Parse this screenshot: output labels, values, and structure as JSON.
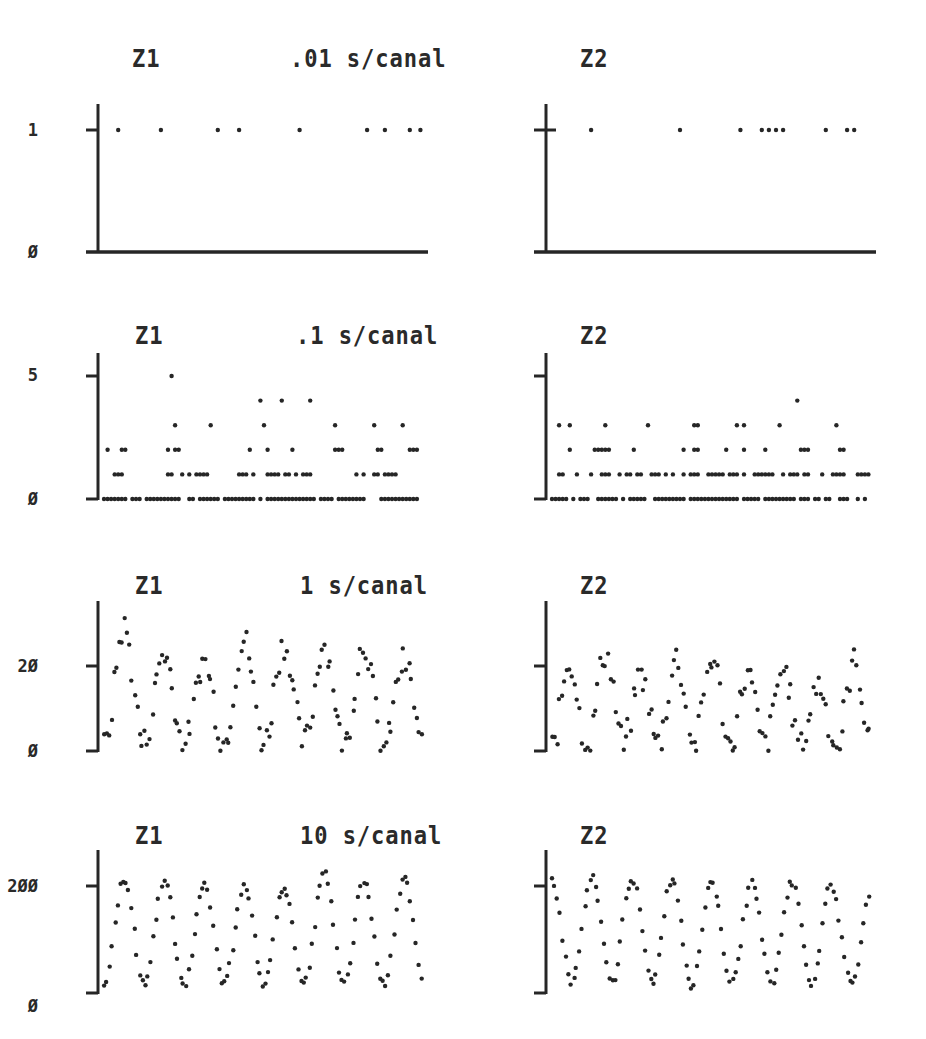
{
  "figure": {
    "top_cutoff_text": "",
    "rows": [
      {
        "left_title": "Z1",
        "scale_label": ".01 s/canal",
        "right_title": "Z2"
      },
      {
        "left_title": "Z1",
        "scale_label": ".1 s/canal",
        "right_title": "Z2"
      },
      {
        "left_title": "Z1",
        "scale_label": "1 s/canal",
        "right_title": "Z2"
      },
      {
        "left_title": "Z1",
        "scale_label": "10 s/canal",
        "right_title": "Z2"
      }
    ],
    "y_tick_labels": [
      {
        "top": "1",
        "bottom": "Ø"
      },
      {
        "top": "5",
        "bottom": "Ø"
      },
      {
        "top": "2Ø",
        "bottom": "Ø"
      },
      {
        "top": "2ØØ",
        "bottom": "Ø"
      }
    ],
    "ink_color": "#262626"
  },
  "chart_data": [
    {
      "type": "scatter",
      "title": "Z1 .01 s/canal",
      "xlabel": "canal",
      "ylabel": "counts",
      "yticks": [
        0,
        1
      ],
      "ylim": [
        0,
        1.2
      ],
      "grid": false,
      "x": [
        4,
        16,
        32,
        38,
        55,
        74,
        79,
        86,
        89
      ],
      "y": [
        1,
        1,
        1,
        1,
        1,
        1,
        1,
        1,
        1
      ],
      "note": "all remaining channels = 0 (baseline)"
    },
    {
      "type": "scatter",
      "title": "Z2 .01 s/canal",
      "xlabel": "canal",
      "ylabel": "counts",
      "yticks": [
        0,
        1
      ],
      "ylim": [
        0,
        1.2
      ],
      "grid": false,
      "x": [
        11,
        36,
        53,
        59,
        61,
        63,
        65,
        77,
        83,
        85
      ],
      "y": [
        1,
        1,
        1,
        1,
        1,
        1,
        1,
        1,
        1,
        1
      ],
      "note": "all remaining channels = 0 (baseline)"
    },
    {
      "type": "scatter",
      "title": "Z1 .1 s/canal",
      "xlabel": "canal",
      "ylabel": "counts",
      "yticks": [
        0,
        5
      ],
      "ylim": [
        0,
        6
      ],
      "grid": false,
      "x": [
        19,
        44,
        50,
        58,
        1,
        5,
        6,
        18,
        20,
        21,
        41,
        46,
        53,
        65,
        66,
        67,
        77,
        78,
        86,
        87,
        88,
        3,
        4,
        5,
        18,
        19,
        22,
        24,
        26,
        27,
        28,
        29,
        38,
        39,
        40,
        42,
        46,
        47,
        48,
        49,
        51,
        52,
        54,
        56,
        57,
        58,
        71,
        73,
        76,
        77,
        79,
        80,
        81,
        82
      ],
      "y": [
        5,
        4,
        4,
        4,
        2,
        2,
        2,
        2,
        2,
        2,
        2,
        2,
        2,
        2,
        2,
        2,
        2,
        2,
        2,
        2,
        2,
        1,
        1,
        1,
        1,
        1,
        1,
        1,
        1,
        1,
        1,
        1,
        1,
        1,
        1,
        1,
        1,
        1,
        1,
        1,
        1,
        1,
        1,
        1,
        1,
        1,
        1,
        1,
        1,
        1,
        1,
        1,
        1,
        1
      ],
      "extra_level3_x": [
        20,
        30,
        45,
        65,
        76,
        84
      ],
      "note": "channels not listed at levels 1-5 sit at 0"
    },
    {
      "type": "scatter",
      "title": "Z2 .1 s/canal",
      "xlabel": "canal",
      "ylabel": "counts",
      "yticks": [
        0,
        5
      ],
      "ylim": [
        0,
        6
      ],
      "grid": false,
      "x": [
        69,
        2,
        5,
        15,
        27,
        40,
        41,
        52,
        54,
        64,
        80,
        5,
        12,
        13,
        14,
        15,
        16,
        23,
        37,
        40,
        41,
        49,
        54,
        60,
        70,
        71,
        72,
        81,
        82
      ],
      "y": [
        4,
        3,
        3,
        3,
        3,
        3,
        3,
        3,
        3,
        3,
        3,
        2,
        2,
        2,
        2,
        2,
        2,
        2,
        2,
        2,
        2,
        2,
        2,
        2,
        2,
        2,
        2,
        2,
        2
      ],
      "level1_note": "dense runs of 1s across most channels",
      "note": "channels not listed at levels 1-4 sit at 0"
    },
    {
      "type": "scatter",
      "title": "Z1 1 s/canal",
      "xlabel": "canal",
      "ylabel": "counts",
      "yticks": [
        0,
        20
      ],
      "ylim": [
        0,
        35
      ],
      "grid": false,
      "periods": 8,
      "amplitude_range": [
        0,
        29
      ],
      "peak_values": [
        29,
        23,
        21,
        26,
        25,
        25,
        25,
        21
      ],
      "trough_values": [
        1,
        2,
        2,
        2,
        2,
        2,
        1,
        1
      ],
      "note": "oscillating point series, ~8 cycles across the x range"
    },
    {
      "type": "scatter",
      "title": "Z2 1 s/canal",
      "xlabel": "canal",
      "ylabel": "counts",
      "yticks": [
        0,
        20
      ],
      "ylim": [
        0,
        35
      ],
      "grid": false,
      "periods": 9,
      "amplitude_range": [
        0,
        23
      ],
      "peak_values": [
        21,
        23,
        18,
        22,
        22,
        18,
        19,
        16,
        21
      ],
      "trough_values": [
        1,
        2,
        1,
        2,
        1,
        1,
        2,
        1,
        1
      ],
      "note": "oscillating point series, ~9 cycles"
    },
    {
      "type": "scatter",
      "title": "Z1 10 s/canal",
      "xlabel": "canal",
      "ylabel": "counts",
      "yticks": [
        0,
        200
      ],
      "ylim": [
        0,
        270
      ],
      "grid": false,
      "periods": 8,
      "amplitude_range": [
        10,
        225
      ],
      "peak_values": [
        215,
        210,
        205,
        200,
        200,
        225,
        210,
        215
      ],
      "trough_values": [
        15,
        15,
        15,
        15,
        15,
        15,
        15,
        15
      ],
      "note": "regular sinusoidal point series, ~8 cycles"
    },
    {
      "type": "scatter",
      "title": "Z2 10 s/canal",
      "xlabel": "canal",
      "ylabel": "counts",
      "yticks": [
        0,
        200
      ],
      "ylim": [
        0,
        270
      ],
      "grid": false,
      "periods": 8,
      "amplitude_range": [
        10,
        220
      ],
      "peak_values": [
        215,
        215,
        215,
        215,
        205,
        210,
        205,
        190
      ],
      "trough_values": [
        20,
        20,
        20,
        15,
        20,
        20,
        20,
        20
      ],
      "note": "regular sinusoidal point series, ~8 cycles"
    }
  ]
}
